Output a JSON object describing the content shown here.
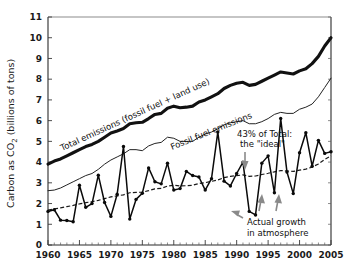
{
  "chart_data": {
    "type": "line",
    "title": "",
    "xlabel": "",
    "ylabel": "Carbon as CO2 (billions of tons)",
    "ylabel_parts": {
      "pre": "Carbon as CO",
      "sub": "2",
      "post": " (billions of tons)"
    },
    "xlim": [
      1960,
      2005
    ],
    "ylim": [
      0,
      11
    ],
    "grid": false,
    "legend_position": "inline-annotations",
    "x_tick_labels": [
      "1960",
      "1965",
      "1970",
      "1975",
      "1980",
      "1985",
      "1990",
      "1995",
      "2000",
      "2005"
    ],
    "x_ticks": [
      1960,
      1965,
      1970,
      1975,
      1980,
      1985,
      1990,
      1995,
      2000,
      2005
    ],
    "y_tick_labels": [
      "0",
      "1",
      "2",
      "3",
      "4",
      "5",
      "6",
      "7",
      "8",
      "9",
      "10",
      "11"
    ],
    "y_ticks": [
      0,
      1,
      2,
      3,
      4,
      5,
      6,
      7,
      8,
      9,
      10,
      11
    ],
    "x": [
      1960,
      1961,
      1962,
      1963,
      1964,
      1965,
      1966,
      1967,
      1968,
      1969,
      1970,
      1971,
      1972,
      1973,
      1974,
      1975,
      1976,
      1977,
      1978,
      1979,
      1980,
      1981,
      1982,
      1983,
      1984,
      1985,
      1986,
      1987,
      1988,
      1989,
      1990,
      1991,
      1992,
      1993,
      1994,
      1995,
      1996,
      1997,
      1998,
      1999,
      2000,
      2001,
      2002,
      2003,
      2004,
      2005
    ],
    "series": [
      {
        "name": "Total emissions (fossil fuel + land use)",
        "style": "thick-solid",
        "label": "Total emissions (fossil fuel + land use)",
        "values": [
          3.9,
          4.05,
          4.15,
          4.3,
          4.45,
          4.6,
          4.75,
          4.85,
          5.0,
          5.2,
          5.4,
          5.5,
          5.62,
          5.85,
          5.9,
          5.92,
          6.1,
          6.3,
          6.35,
          6.6,
          6.7,
          6.62,
          6.65,
          6.7,
          6.9,
          7.0,
          7.15,
          7.3,
          7.55,
          7.7,
          7.8,
          7.85,
          7.7,
          7.75,
          7.9,
          8.05,
          8.2,
          8.35,
          8.3,
          8.25,
          8.4,
          8.5,
          8.75,
          9.1,
          9.6,
          10.0
        ]
      },
      {
        "name": "Fossil fuel emissions",
        "style": "thin-solid",
        "label": "Fossil fuel emissions",
        "values": [
          2.62,
          2.65,
          2.75,
          2.9,
          3.05,
          3.2,
          3.35,
          3.45,
          3.65,
          3.9,
          4.1,
          4.25,
          4.4,
          4.6,
          4.6,
          4.55,
          4.78,
          4.9,
          4.95,
          5.2,
          5.15,
          5.0,
          5.0,
          5.0,
          5.2,
          5.35,
          5.45,
          5.6,
          5.8,
          5.9,
          5.95,
          6.0,
          5.85,
          5.85,
          5.95,
          6.1,
          6.3,
          6.4,
          6.35,
          6.35,
          6.55,
          6.65,
          6.8,
          7.15,
          7.6,
          8.05
        ]
      },
      {
        "name": "43% of Total: the \"ideal\"",
        "style": "dashed",
        "label": "43% of  Total: the \"ideal\"",
        "values": [
          1.68,
          1.74,
          1.79,
          1.85,
          1.91,
          1.98,
          2.04,
          2.09,
          2.15,
          2.24,
          2.32,
          2.37,
          2.42,
          2.52,
          2.54,
          2.55,
          2.62,
          2.71,
          2.73,
          2.84,
          2.88,
          2.85,
          2.86,
          2.88,
          2.97,
          3.01,
          3.07,
          3.14,
          3.25,
          3.31,
          3.35,
          3.38,
          3.31,
          3.33,
          3.4,
          3.46,
          3.53,
          3.59,
          3.57,
          3.55,
          3.61,
          3.66,
          3.76,
          3.91,
          4.13,
          4.3
        ]
      },
      {
        "name": "Actual growth in atmosphere",
        "style": "jagged-markers",
        "label": "Actual growth in atmosphere",
        "values": [
          1.62,
          1.7,
          1.2,
          1.18,
          1.12,
          2.88,
          1.82,
          2.0,
          3.37,
          2.05,
          1.38,
          2.45,
          4.75,
          1.25,
          2.2,
          2.5,
          3.72,
          3.05,
          2.95,
          3.95,
          2.65,
          2.72,
          3.55,
          3.35,
          3.28,
          2.65,
          3.2,
          5.45,
          3.08,
          2.85,
          3.45,
          4.0,
          1.62,
          1.45,
          3.95,
          4.3,
          2.52,
          6.1,
          3.52,
          2.48,
          4.45,
          5.42,
          3.8,
          5.05,
          4.42,
          4.5
        ]
      }
    ],
    "annotations": [
      {
        "name": "total-emissions-label",
        "text": "Total emissions (fossil fuel + land use)"
      },
      {
        "name": "fossil-fuel-label",
        "text": "Fossil fuel emissions"
      },
      {
        "name": "ideal-label-line1",
        "text": "43% of  Total:"
      },
      {
        "name": "ideal-label-line2",
        "text": "the \"ideal\""
      },
      {
        "name": "actual-growth-line1",
        "text": "Actual growth"
      },
      {
        "name": "actual-growth-line2",
        "text": "in atmosphere"
      }
    ],
    "colors": {
      "total": "#111111",
      "fossil": "#222222",
      "ideal": "#1a1a1a",
      "actual": "#0a0a0a",
      "arrow": "#8a8a8a",
      "background": "#ffffff"
    }
  }
}
